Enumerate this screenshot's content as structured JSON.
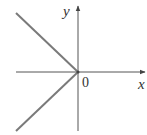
{
  "figure": {
    "type": "graph-of-function",
    "axes": {
      "x_label": "x",
      "y_label": "y",
      "origin_label": "0"
    },
    "colors": {
      "axis": "#555555",
      "curve": "#7a7a7a",
      "text": "#333333"
    },
    "rays": [
      {
        "name": "upper-left-ray",
        "from": [
          0,
          0
        ],
        "direction": "up-left",
        "slope": -1
      },
      {
        "name": "lower-left-ray",
        "from": [
          0,
          0
        ],
        "direction": "down-left",
        "slope": 1
      }
    ]
  }
}
